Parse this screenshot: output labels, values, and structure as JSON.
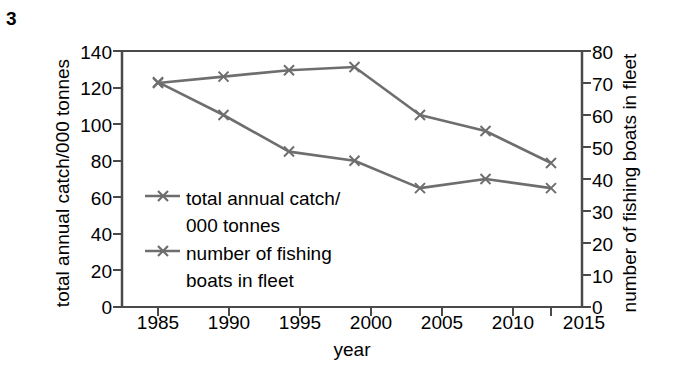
{
  "figure": {
    "number": "3"
  },
  "chart_data": {
    "type": "line",
    "title": "",
    "xlabel": "year",
    "categories": [
      "1985",
      "1990",
      "1995",
      "2000",
      "2005",
      "2010",
      "2015"
    ],
    "x": [
      1985,
      1990,
      1995,
      2000,
      2005,
      2010,
      2015
    ],
    "xlim": [
      1983,
      2017
    ],
    "grid": false,
    "legend_position": "inside-lower-left",
    "series": [
      {
        "name": "total annual catch/ 000 tonnes",
        "axis": "left",
        "values": [
          123,
          105,
          85,
          80,
          65,
          70,
          65
        ],
        "color": "#6e6e6e",
        "marker": "x"
      },
      {
        "name": "number of fishing boats in fleet",
        "axis": "right",
        "values": [
          70,
          72,
          74,
          75,
          60,
          55,
          45
        ],
        "color": "#6e6e6e",
        "marker": "x"
      }
    ],
    "axes": {
      "left": {
        "label": "total annual catch/000 tonnes",
        "ticks": [
          "140",
          "120",
          "100",
          "80",
          "60",
          "40",
          "20",
          "0"
        ],
        "tick_values": [
          140,
          120,
          100,
          80,
          60,
          40,
          20,
          0
        ],
        "ylim": [
          0,
          140
        ]
      },
      "right": {
        "label": "number of fishing boats in fleet",
        "ticks": [
          "80",
          "70",
          "60",
          "50",
          "40",
          "30",
          "20",
          "10",
          "0"
        ],
        "tick_values": [
          80,
          70,
          60,
          50,
          40,
          30,
          20,
          10,
          0
        ],
        "ylim": [
          0,
          80
        ]
      }
    }
  },
  "legend": {
    "items": [
      {
        "line1": "total annual catch/",
        "line2": "000 tonnes"
      },
      {
        "line1": "number of fishing",
        "line2": "boats in fleet"
      }
    ]
  },
  "colors": {
    "series": "#6e6e6e",
    "axis": "#4a4a4a",
    "text": "#000000",
    "background": "#ffffff"
  }
}
